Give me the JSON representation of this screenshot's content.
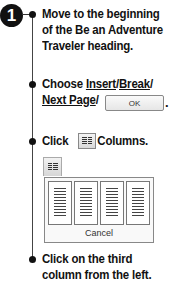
{
  "step": {
    "number": "1"
  },
  "instructions": [
    {
      "lines": [
        "Move to the beginning",
        "of the Be an Adventure",
        "Traveler heading."
      ]
    },
    {
      "line1_pre": "Choose ",
      "insert": "Insert",
      "slash1": "/",
      "break": "Break",
      "slash2": "/",
      "next_page": "Next Page",
      "slash3": "/",
      "ok_label": "OK",
      "end": "."
    },
    {
      "click": "Click",
      "columns": "Columns."
    },
    {
      "lines": [
        "Click on the third",
        "column from the left."
      ]
    }
  ],
  "columns_picker": {
    "cards": [
      "1 column",
      "2 columns",
      "3 columns",
      "4 columns"
    ],
    "cancel_label": "Cancel"
  }
}
